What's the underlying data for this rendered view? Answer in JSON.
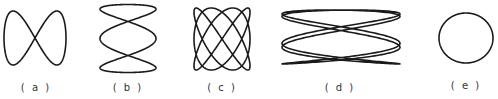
{
  "stroke_color": "#1a1a1a",
  "figures": [
    {
      "id": "a",
      "label": "( a )",
      "fx": 1,
      "fy": 2,
      "phase": 0,
      "cx": 35,
      "cy": 38,
      "rx": 31,
      "ry": 27,
      "label_x": 36,
      "label_y": 82
    },
    {
      "id": "b",
      "label": "( b )",
      "fx": 1,
      "fy": 3,
      "phase": 1.5708,
      "cx": 128,
      "cy": 38.5,
      "rx": 28,
      "ry": 34,
      "label_x": 128,
      "label_y": 82,
      "swap": true
    },
    {
      "id": "c",
      "label": "( c )",
      "fx": 3,
      "fy": 4,
      "phase": 0.785,
      "cx": 222,
      "cy": 39,
      "rx": 28,
      "ry": 31,
      "label_x": 222,
      "label_y": 82
    },
    {
      "id": "d",
      "label": "( d )",
      "fx": 5,
      "fy": 2,
      "phase": 0.6,
      "cx": 341,
      "cy": 37,
      "rx": 59,
      "ry": 27,
      "label_x": 340,
      "label_y": 82
    },
    {
      "id": "e",
      "label": "( e )",
      "fx": 1,
      "fy": 1,
      "phase": 1.5708,
      "cx": 466,
      "cy": 38,
      "rx": 27,
      "ry": 25,
      "label_x": 466,
      "label_y": 80
    }
  ]
}
